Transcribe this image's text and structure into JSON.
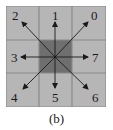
{
  "diagram": {
    "caption": "(b)",
    "colors": {
      "cell": "#b6b6b6",
      "center_cell": "#6f6f6f",
      "grid_line": "#8e8e8e",
      "arrow": "#1a1a1a"
    },
    "directions": [
      {
        "label": "0",
        "position": "top-right"
      },
      {
        "label": "1",
        "position": "top"
      },
      {
        "label": "2",
        "position": "top-left"
      },
      {
        "label": "3",
        "position": "left"
      },
      {
        "label": "4",
        "position": "bottom-left"
      },
      {
        "label": "5",
        "position": "bottom"
      },
      {
        "label": "6",
        "position": "bottom-right"
      },
      {
        "label": "7",
        "position": "right"
      }
    ]
  }
}
